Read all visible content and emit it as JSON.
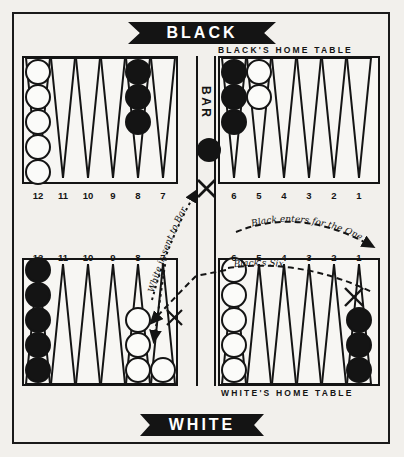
{
  "page": {
    "background_color": "#f2f0ec",
    "ink_color": "#141414"
  },
  "banners": {
    "top": {
      "label": "BLACK",
      "name": "black-player-banner"
    },
    "bottom": {
      "label": "WHITE",
      "name": "white-player-banner"
    }
  },
  "captions": {
    "black_home": "BLACK'S HOME TABLE",
    "white_home": "WHITE'S HOME TABLE"
  },
  "bar": {
    "label": "BAR",
    "checker_color": "black",
    "checker_count": 1
  },
  "point_numbers": {
    "top_left": [
      "12",
      "11",
      "10",
      "9",
      "8",
      "7"
    ],
    "top_right": [
      "6",
      "5",
      "4",
      "3",
      "2",
      "1"
    ],
    "bottom_left": [
      "12",
      "11",
      "10",
      "9",
      "8",
      "7"
    ],
    "bottom_right": [
      "6",
      "5",
      "4",
      "3",
      "2",
      "1"
    ]
  },
  "checkers": {
    "top_left": [
      {
        "point": "12",
        "color": "white",
        "count": 5
      },
      {
        "point": "11",
        "color": "none",
        "count": 0
      },
      {
        "point": "10",
        "color": "none",
        "count": 0
      },
      {
        "point": "9",
        "color": "none",
        "count": 0
      },
      {
        "point": "8",
        "color": "black",
        "count": 3
      },
      {
        "point": "7",
        "color": "none",
        "count": 0
      }
    ],
    "top_right": [
      {
        "point": "6",
        "color": "black",
        "count": 3
      },
      {
        "point": "5",
        "color": "white",
        "count": 2
      },
      {
        "point": "4",
        "color": "none",
        "count": 0
      },
      {
        "point": "3",
        "color": "none",
        "count": 0
      },
      {
        "point": "2",
        "color": "none",
        "count": 0
      },
      {
        "point": "1",
        "color": "none",
        "count": 0
      }
    ],
    "bottom_left": [
      {
        "point": "12",
        "color": "black",
        "count": 5
      },
      {
        "point": "11",
        "color": "none",
        "count": 0
      },
      {
        "point": "10",
        "color": "none",
        "count": 0
      },
      {
        "point": "9",
        "color": "none",
        "count": 0
      },
      {
        "point": "8",
        "color": "white",
        "count": 3
      },
      {
        "point": "7",
        "color": "white",
        "count": 1
      }
    ],
    "bottom_right": [
      {
        "point": "6",
        "color": "white",
        "count": 5
      },
      {
        "point": "5",
        "color": "none",
        "count": 0
      },
      {
        "point": "4",
        "color": "none",
        "count": 0
      },
      {
        "point": "3",
        "color": "none",
        "count": 0
      },
      {
        "point": "2",
        "color": "none",
        "count": 0
      },
      {
        "point": "1",
        "color": "black",
        "count": 3
      }
    ]
  },
  "annotations": {
    "white_sent_to_bar": "White is sent to Bar",
    "black_enters_for_the_one": "Black enters for the One",
    "blacks_six": "Black's Six"
  },
  "markers": {
    "x_marks": [
      {
        "name": "x-mark-bar",
        "meaning": "hit on bar"
      },
      {
        "name": "x-mark-bottom-left-point-7",
        "meaning": "white blot hit at point 7"
      },
      {
        "name": "x-mark-bottom-right-point-1",
        "meaning": "black lands on point 1"
      }
    ]
  }
}
